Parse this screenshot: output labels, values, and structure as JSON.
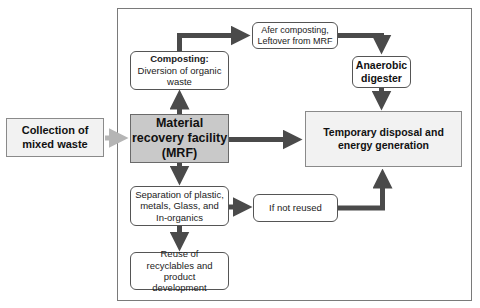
{
  "diagram": {
    "title": "",
    "nodes": {
      "collection": {
        "label": "Collection of mixed waste"
      },
      "mrf": {
        "label_line1": "Material",
        "label_line2": "recovery facility",
        "label_line3": "(MRF)"
      },
      "composting": {
        "title": "Composting:",
        "body": "Diversion of organic waste"
      },
      "after_composting": {
        "line1": "Afer composting,",
        "line2": "Leftover from MRF"
      },
      "anaerobic": {
        "line1": "Anaerobic",
        "line2": "digester"
      },
      "temporary": {
        "label": "Temporary disposal and energy generation"
      },
      "separation": {
        "label": "Separation of plastic, metals, Glass, and In-organics"
      },
      "not_reused": {
        "label": "If not reused"
      },
      "reuse": {
        "label": "Reuse of recyclables and product development"
      }
    },
    "edges": [
      {
        "from": "collection",
        "to": "mrf"
      },
      {
        "from": "mrf",
        "to": "composting"
      },
      {
        "from": "composting",
        "to": "after_composting"
      },
      {
        "from": "after_composting",
        "to": "anaerobic"
      },
      {
        "from": "anaerobic",
        "to": "temporary"
      },
      {
        "from": "mrf",
        "to": "temporary"
      },
      {
        "from": "mrf",
        "to": "separation"
      },
      {
        "from": "separation",
        "to": "not_reused"
      },
      {
        "from": "not_reused",
        "to": "temporary"
      },
      {
        "from": "separation",
        "to": "reuse"
      }
    ],
    "colors": {
      "arrow": "#4a4a4a",
      "input_arrow": "#b5b5b5",
      "mrf_fill": "#c9c9c9",
      "light_fill": "#f2f2f2",
      "frame": "#7a7a7a"
    }
  }
}
